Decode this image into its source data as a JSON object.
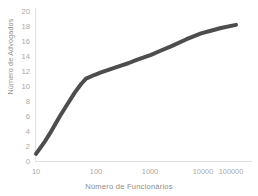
{
  "chart_data": {
    "type": "line",
    "title": "",
    "subtitle": "",
    "xlabel": "Número de Funcionários",
    "ylabel": "Número de Advogados",
    "xscale": "log",
    "yscale": "linear",
    "xlim": [
      10,
      100000
    ],
    "ylim": [
      0,
      20
    ],
    "grid": false,
    "legend": false,
    "legend_position": "none",
    "xticks": [
      "10",
      "100",
      "1000",
      "10000",
      "100000"
    ],
    "xtick_values": [
      10,
      100,
      1000,
      10000,
      100000
    ],
    "yticks": [
      "0",
      "2",
      "4",
      "6",
      "8",
      "10",
      "12",
      "14",
      "16",
      "18",
      "20"
    ],
    "ytick_values": [
      0,
      2,
      4,
      6,
      8,
      10,
      12,
      14,
      16,
      18,
      20
    ],
    "series": [
      {
        "name": "Número de Advogados",
        "color": "#4d4d4d",
        "linewidth": 4,
        "x": [
          10,
          15,
          20,
          30,
          40,
          60,
          80,
          100,
          150,
          200,
          300,
          500,
          700,
          1000,
          2000,
          3000,
          5000,
          10000,
          20000,
          30000,
          50000,
          100000
        ],
        "y": [
          1.0,
          2.6,
          3.9,
          5.9,
          7.2,
          9.0,
          10.1,
          10.8,
          11.3,
          11.6,
          12.0,
          12.5,
          12.8,
          13.2,
          13.9,
          14.4,
          15.0,
          15.9,
          16.7,
          17.0,
          17.4,
          17.8
        ]
      }
    ],
    "annotations": []
  },
  "axes": {
    "y_axis_label": "Número de Advogados",
    "x_axis_label": "Número de Funcionários"
  },
  "colors": {
    "line": "#4d4d4d",
    "tick_text": "#a9a9a9",
    "axis_label_text": "#8d8d8d",
    "background": "#ffffff"
  }
}
